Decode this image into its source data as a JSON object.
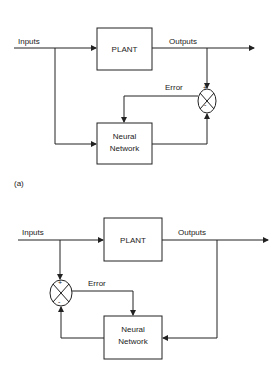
{
  "diagram_a": {
    "caption": "(a)",
    "inputs_label": "Inputs",
    "outputs_label": "Outputs",
    "plant_label": "PLANT",
    "nn_line1": "Neural",
    "nn_line2": "Network",
    "error_label": "Error",
    "plus": "+",
    "minus": "-"
  },
  "diagram_b": {
    "inputs_label": "Inputs",
    "outputs_label": "Outputs",
    "plant_label": "PLANT",
    "nn_line1": "Neural",
    "nn_line2": "Network",
    "error_label": "Error",
    "plus": "+",
    "minus": "-"
  }
}
